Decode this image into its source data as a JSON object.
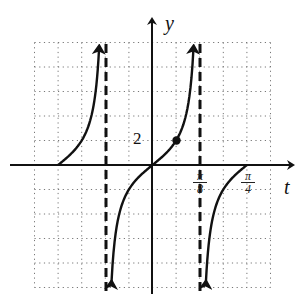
{
  "chart_data": {
    "type": "line",
    "title": "",
    "function": "y = 2 tan(4t)",
    "xlabel": "t",
    "ylabel": "y",
    "x_tick_labels": [
      {
        "label_num": "π",
        "label_den": "8",
        "value": "π/8"
      },
      {
        "label_num": "π",
        "label_den": "4",
        "value": "π/4"
      }
    ],
    "y_tick_labels": [
      {
        "label": "2",
        "value": 2
      }
    ],
    "x_grid_step": "π/16",
    "y_grid_step": 2,
    "xlim": [
      "-7π/16",
      "5π/16"
    ],
    "ylim": [
      -10,
      10
    ],
    "grid": true,
    "grid_style": "dotted",
    "asymptotes": [
      {
        "t": "-π/8",
        "style": "dashed"
      },
      {
        "t": "π/8",
        "style": "dashed"
      }
    ],
    "highlighted_points": [
      {
        "t": "π/16",
        "y": 2
      }
    ],
    "series": [
      {
        "name": "branch-left",
        "t_range": [
          "-π/4",
          "-π/8"
        ],
        "points": [
          [
            "-π/4",
            0
          ],
          [
            "-3π/16",
            2
          ],
          [
            "-5π/32",
            4.83
          ],
          [
            "-0.42",
            9.8
          ]
        ]
      },
      {
        "name": "branch-center",
        "t_range": [
          "-π/8",
          "π/8"
        ],
        "points": [
          [
            "-0.35",
            -9.8
          ],
          [
            "-π/16",
            -2
          ],
          [
            0,
            0
          ],
          [
            "π/16",
            2
          ],
          [
            "0.35",
            9.8
          ]
        ]
      },
      {
        "name": "branch-right",
        "t_range": [
          "π/8",
          "π/4"
        ],
        "points": [
          [
            "0.43",
            -9.8
          ],
          [
            "3π/16",
            -2
          ],
          [
            "π/4",
            0
          ]
        ]
      }
    ],
    "legend": null
  },
  "labels": {
    "y_axis": "y",
    "t_axis": "t",
    "y_tick": "2",
    "pi8_num": "π",
    "pi8_den": "8",
    "pi4_num": "π",
    "pi4_den": "4"
  }
}
